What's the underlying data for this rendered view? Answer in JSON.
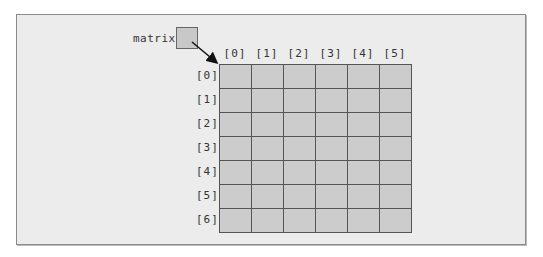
{
  "diagram": {
    "variable_label": "matrix",
    "column_headers": [
      "[0]",
      "[1]",
      "[2]",
      "[3]",
      "[4]",
      "[5]"
    ],
    "row_headers": [
      "[0]",
      "[1]",
      "[2]",
      "[3]",
      "[4]",
      "[5]",
      "[6]"
    ],
    "rows": 7,
    "columns": 6,
    "colors": {
      "background": "#ececec",
      "cell_fill": "#cccccc",
      "grid_line": "#555555",
      "reference_box": "#c8c8c8"
    }
  }
}
